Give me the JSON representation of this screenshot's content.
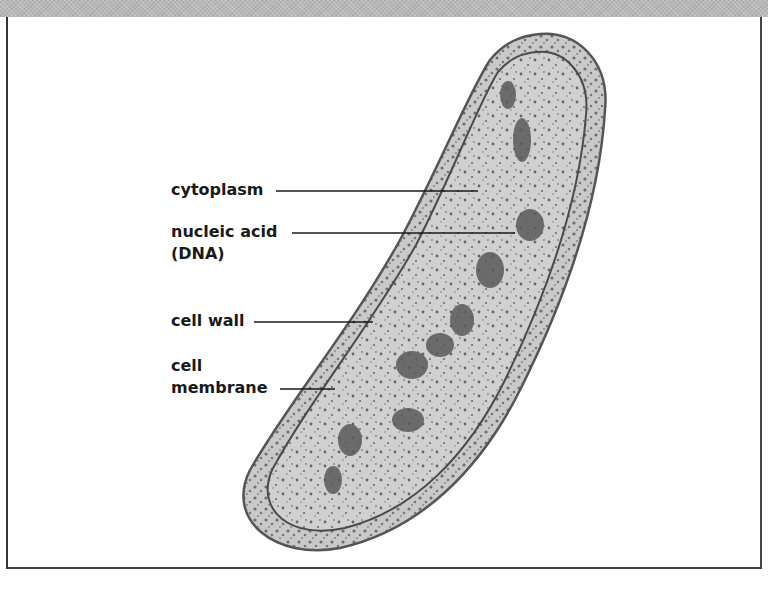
{
  "diagram": {
    "labels": [
      {
        "id": "cytoplasm",
        "text": "cytoplasm"
      },
      {
        "id": "nucleic-acid",
        "text": "nucleic acid",
        "text2": "(DNA)"
      },
      {
        "id": "cell-wall",
        "text": "cell wall"
      },
      {
        "id": "cell-membrane",
        "text": "cell",
        "text2": "membrane"
      }
    ]
  },
  "colors": {
    "band": "#b8b8b8",
    "cell_fill": "#c9c9c9",
    "cell_outline": "#555555",
    "dots": "#4a4a4a",
    "text": "#1a1a1a"
  }
}
